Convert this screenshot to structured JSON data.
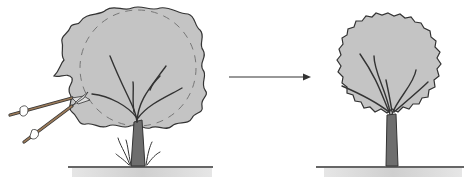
{
  "diagram": {
    "panels": [
      {
        "name": "before",
        "label": "Overgrown tree with shears pruning along dashed outline"
      },
      {
        "name": "after",
        "label": "Pruned tree with neat round crown"
      }
    ],
    "arrow": {
      "direction": "right"
    },
    "colors": {
      "canopy": "#c4c4c4",
      "outline": "#333333",
      "trunk": "#6e6e6e",
      "ground_shadow": "#d6d6d6"
    }
  }
}
